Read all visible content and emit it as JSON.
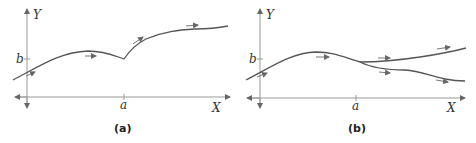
{
  "panels": [
    {
      "caption": "(a)",
      "y_label": "Y",
      "x_label": "X",
      "y_tick": "b",
      "x_tick": "a",
      "description": "single trajectory with a kink at x=a"
    },
    {
      "caption": "(b)",
      "y_label": "Y",
      "x_label": "X",
      "y_tick": "b",
      "x_tick": "a",
      "description": "trajectory branching into two paths at x=a"
    }
  ],
  "colors": {
    "axis": "#888888",
    "curve": "#555555",
    "text": "#333333"
  }
}
